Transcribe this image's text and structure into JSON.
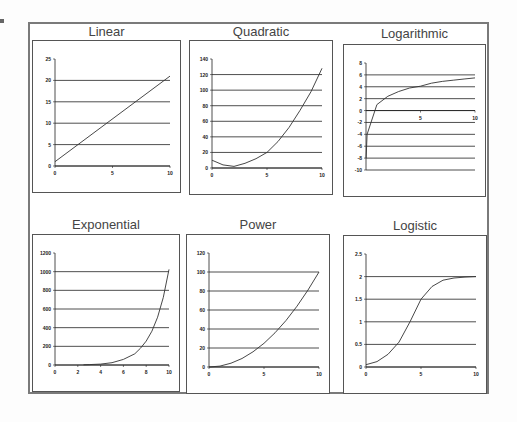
{
  "chart_data": [
    {
      "type": "line",
      "title": "Linear",
      "xlabel": "",
      "ylabel": "",
      "xlim": [
        0,
        10
      ],
      "ylim": [
        0,
        25
      ],
      "x_ticks": [
        "0",
        "5",
        "10"
      ],
      "y_ticks": [
        "0",
        "5",
        "10",
        "15",
        "20",
        "25"
      ],
      "grid": "horizontal",
      "x": [
        0,
        10
      ],
      "values": [
        1,
        21
      ]
    },
    {
      "type": "line",
      "title": "Quadratic",
      "xlabel": "",
      "ylabel": "",
      "xlim": [
        0,
        10
      ],
      "ylim": [
        0,
        140
      ],
      "x_ticks": [
        "0",
        "5",
        "10"
      ],
      "y_ticks": [
        "0",
        "20",
        "40",
        "60",
        "80",
        "100",
        "120",
        "140"
      ],
      "grid": "horizontal",
      "x": [
        0,
        1,
        2,
        3,
        4,
        5,
        6,
        7,
        8,
        9,
        10
      ],
      "values": [
        10,
        4,
        2,
        6,
        12,
        20,
        34,
        52,
        74,
        98,
        128
      ]
    },
    {
      "type": "line",
      "title": "Logarithmic",
      "xlabel": "",
      "ylabel": "",
      "xlim": [
        0,
        10
      ],
      "ylim": [
        -10,
        8
      ],
      "x_ticks": [
        "5",
        "10"
      ],
      "y_ticks": [
        "-10",
        "-8",
        "-6",
        "-4",
        "-2",
        "0",
        "2",
        "4",
        "6",
        "8"
      ],
      "grid": "horizontal",
      "x": [
        0.01,
        0.1,
        1,
        2,
        3,
        4,
        5,
        6,
        7,
        8,
        9,
        10
      ],
      "values": [
        -8,
        -4,
        1,
        2.4,
        3.2,
        3.8,
        4.1,
        4.6,
        4.9,
        5.1,
        5.3,
        5.5
      ]
    },
    {
      "type": "line",
      "title": "Exponential",
      "xlabel": "",
      "ylabel": "",
      "xlim": [
        0,
        10
      ],
      "ylim": [
        0,
        1200
      ],
      "x_ticks": [
        "0",
        "2",
        "4",
        "6",
        "8",
        "10"
      ],
      "y_ticks": [
        "0",
        "200",
        "400",
        "600",
        "800",
        "1000",
        "1200"
      ],
      "grid": "horizontal",
      "x": [
        2.5,
        3,
        4,
        5,
        6,
        7,
        7.5,
        8,
        8.5,
        9,
        9.5,
        10
      ],
      "values": [
        2,
        4,
        10,
        25,
        60,
        120,
        180,
        256,
        362,
        512,
        724,
        1024
      ]
    },
    {
      "type": "line",
      "title": "Power",
      "xlabel": "",
      "ylabel": "",
      "xlim": [
        0,
        10
      ],
      "ylim": [
        0,
        120
      ],
      "x_ticks": [
        "0",
        "5",
        "10"
      ],
      "y_ticks": [
        "0",
        "20",
        "40",
        "60",
        "80",
        "100",
        "120"
      ],
      "grid": "horizontal",
      "x": [
        0,
        1,
        2,
        3,
        4,
        5,
        6,
        7,
        8,
        9,
        10
      ],
      "values": [
        0,
        1,
        4,
        9,
        16,
        25,
        36,
        49,
        64,
        81,
        100
      ]
    },
    {
      "type": "line",
      "title": "Logistic",
      "xlabel": "",
      "ylabel": "",
      "xlim": [
        0,
        10
      ],
      "ylim": [
        0,
        2.5
      ],
      "x_ticks": [
        "0",
        "5",
        "10"
      ],
      "y_ticks": [
        "0",
        "0.5",
        "1",
        "1.5",
        "2",
        "2.5"
      ],
      "grid": "horizontal",
      "x": [
        0,
        1,
        2,
        3,
        4,
        5,
        6,
        7,
        8,
        9,
        10
      ],
      "values": [
        0.05,
        0.12,
        0.28,
        0.55,
        1.0,
        1.5,
        1.78,
        1.92,
        1.97,
        1.99,
        2.0
      ]
    }
  ]
}
